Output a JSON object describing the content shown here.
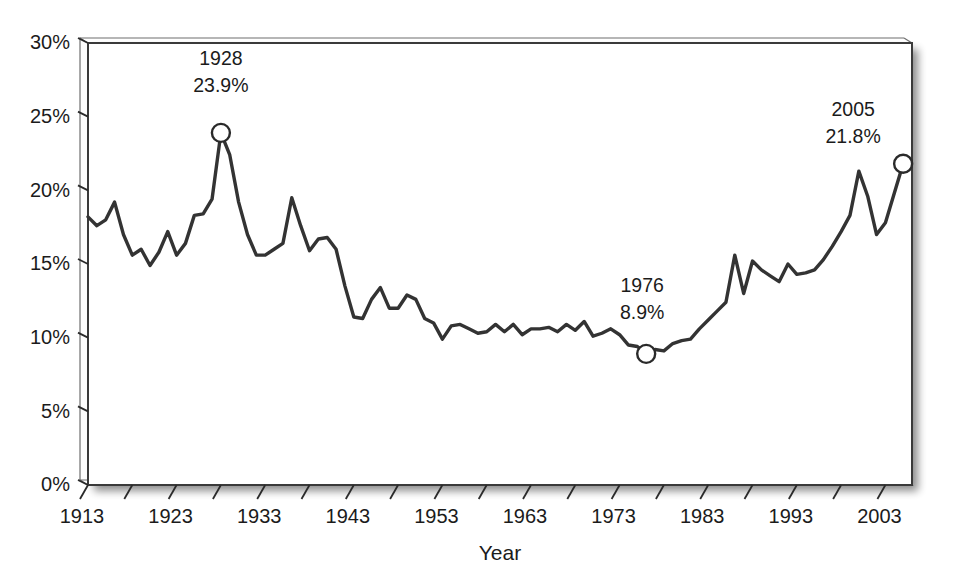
{
  "chart_data": {
    "type": "line",
    "title": "",
    "subtitle": "",
    "xlabel": "Year",
    "ylabel": "",
    "xlim": [
      1913,
      2006
    ],
    "ylim": [
      0,
      30
    ],
    "grid": false,
    "legend": null,
    "y_tick_labels": [
      "0%",
      "5%",
      "10%",
      "15%",
      "20%",
      "25%",
      "30%"
    ],
    "y_tick_values": [
      0,
      5,
      10,
      15,
      20,
      25,
      30
    ],
    "x_tick_labels": [
      "1913",
      "1923",
      "1933",
      "1943",
      "1953",
      "1963",
      "1973",
      "1983",
      "1993",
      "2003"
    ],
    "x_tick_values": [
      1913,
      1923,
      1933,
      1943,
      1953,
      1963,
      1973,
      1983,
      1993,
      2003
    ],
    "x_minor_tick_values": [
      1918,
      1928,
      1938,
      1948,
      1958,
      1968,
      1978,
      1988,
      1998
    ],
    "series": [
      {
        "name": "Share of income",
        "color": "#333333",
        "x": [
          1913,
          1914,
          1915,
          1916,
          1917,
          1918,
          1919,
          1920,
          1921,
          1922,
          1923,
          1924,
          1925,
          1926,
          1927,
          1928,
          1929,
          1930,
          1931,
          1932,
          1933,
          1934,
          1935,
          1936,
          1937,
          1938,
          1939,
          1940,
          1941,
          1942,
          1943,
          1944,
          1945,
          1946,
          1947,
          1948,
          1949,
          1950,
          1951,
          1952,
          1953,
          1954,
          1955,
          1956,
          1957,
          1958,
          1959,
          1960,
          1961,
          1962,
          1963,
          1964,
          1965,
          1966,
          1967,
          1968,
          1969,
          1970,
          1971,
          1972,
          1973,
          1974,
          1975,
          1976,
          1977,
          1978,
          1979,
          1980,
          1981,
          1982,
          1983,
          1984,
          1985,
          1986,
          1987,
          1988,
          1989,
          1990,
          1991,
          1992,
          1993,
          1994,
          1995,
          1996,
          1997,
          1998,
          1999,
          2000,
          2001,
          2002,
          2003,
          2004,
          2005
        ],
        "y": [
          18.2,
          17.6,
          18.0,
          19.2,
          17.0,
          15.6,
          16.0,
          14.9,
          15.8,
          17.2,
          15.6,
          16.4,
          18.3,
          18.4,
          19.4,
          23.9,
          22.4,
          19.2,
          17.0,
          15.6,
          15.6,
          16.0,
          16.4,
          19.5,
          17.6,
          15.9,
          16.7,
          16.8,
          16.0,
          13.5,
          11.4,
          11.3,
          12.6,
          13.4,
          12.0,
          12.0,
          12.9,
          12.6,
          11.3,
          11.0,
          9.9,
          10.8,
          10.9,
          10.6,
          10.3,
          10.4,
          10.9,
          10.4,
          10.9,
          10.2,
          10.6,
          10.6,
          10.7,
          10.4,
          10.9,
          10.5,
          11.1,
          10.1,
          10.3,
          10.6,
          10.2,
          9.5,
          9.4,
          8.9,
          9.2,
          9.1,
          9.6,
          9.8,
          9.9,
          10.6,
          11.2,
          11.8,
          12.4,
          15.6,
          13.0,
          15.2,
          14.6,
          14.2,
          13.8,
          15.0,
          14.3,
          14.4,
          14.6,
          15.3,
          16.2,
          17.2,
          18.3,
          21.3,
          19.6,
          17.0,
          17.8,
          19.8,
          21.8
        ],
        "unit": "%"
      }
    ],
    "annotations": [
      {
        "name": "peak-1928",
        "year": 1928,
        "value": 23.9,
        "label_year": "1928",
        "label_value": "23.9%",
        "marker": "open-circle",
        "label_dx": 0,
        "label_dy": -68
      },
      {
        "name": "trough-1976",
        "year": 1976,
        "value": 8.9,
        "label_year": "1976",
        "label_value": "8.9%",
        "marker": "open-circle",
        "label_dx": -4,
        "label_dy": -62
      },
      {
        "name": "end-2005",
        "year": 2005,
        "value": 21.8,
        "label_year": "2005",
        "label_value": "21.8%",
        "marker": "open-circle",
        "label_dx": -50,
        "label_dy": -48
      }
    ],
    "colors": {
      "line": "#333333",
      "axis": "#2a2a2a",
      "text": "#1b1b1b",
      "marker_fill": "#ffffff",
      "background": "#ffffff"
    }
  }
}
